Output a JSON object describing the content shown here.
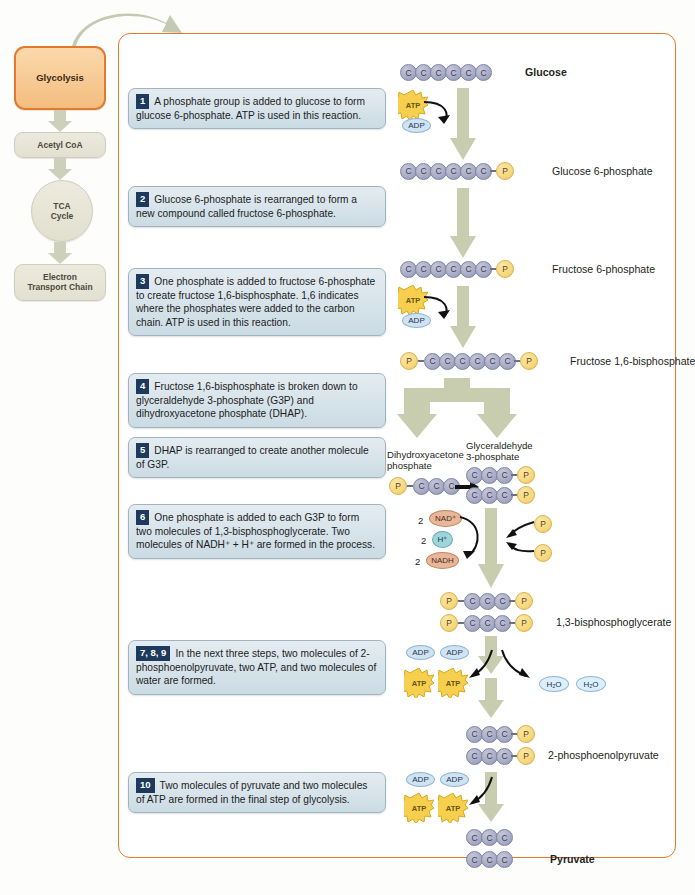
{
  "pathway": {
    "items": [
      {
        "label": "Glycolysis",
        "shape": "box-active"
      },
      {
        "label": "Acetyl CoA",
        "shape": "box"
      },
      {
        "label": "TCA\nCycle",
        "shape": "circle"
      },
      {
        "label": "Electron\nTransport Chain",
        "shape": "box"
      }
    ],
    "active_color": "#e2792b"
  },
  "steps": [
    {
      "num": "1",
      "text": "A phosphate group is added to glucose to form glucose 6-phosphate. ATP is used in this reaction."
    },
    {
      "num": "2",
      "text": "Glucose 6-phosphate is rearranged to form a new compound called fructose 6-phosphate."
    },
    {
      "num": "3",
      "text": "One phosphate is added to fructose 6-phosphate to create fructose 1,6-bisphosphate. 1,6 indicates where the phosphates were added to the carbon chain. ATP is used in this reaction."
    },
    {
      "num": "4",
      "text": "Fructose 1,6-bisphosphate is broken down to glyceraldehyde 3-phosphate (G3P) and dihydroxyacetone phosphate (DHAP)."
    },
    {
      "num": "5",
      "text": "DHAP is rearranged to create another molecule of G3P."
    },
    {
      "num": "6",
      "text": "One phosphate is added to each G3P to form two molecules of 1,3-bisphosphoglycerate. Two molecules of NADH⁺ + H⁺ are formed in the process."
    },
    {
      "num": "7, 8, 9",
      "text": "In the next three steps, two molecules of 2-phosphoenolpyruvate, two ATP, and two molecules of water are formed."
    },
    {
      "num": "10",
      "text": "Two molecules of pyruvate and two molecules of ATP are formed in the final step of glycolysis."
    }
  ],
  "molecules": {
    "glucose": "Glucose",
    "glucose6p": "Glucose 6-phosphate",
    "fructose6p": "Fructose 6-phosphate",
    "fructose16bp": "Fructose 1,6-bisphosphate",
    "dhap": "Dihydroxyacetone\nphosphate",
    "g3p": "Glyceraldehyde\n3-phosphate",
    "bpg": "1,3-bisphosphoglycerate",
    "pep": "2-phosphoenolpyruvate",
    "pyruvate": "Pyruvate"
  },
  "symbols": {
    "carbon": "C",
    "phosphate": "P",
    "atp": "ATP",
    "adp": "ADP",
    "water": "H₂O",
    "nad_plus": "NAD⁺",
    "nadh": "NADH",
    "h_plus": "H⁺",
    "two": "2"
  },
  "colors": {
    "panel_border": "#e2792b",
    "carbon_fill": "#a7aac4",
    "phosphate_fill": "#f6d87e",
    "step_box": "#cbdbe4",
    "step_num_box": "#1d3a5c",
    "flow_arrow": "#c8cdb0",
    "nad_fill": "#e8b79a",
    "h_fill": "#9fd6dc",
    "adp_fill": "#cfe3f2"
  }
}
